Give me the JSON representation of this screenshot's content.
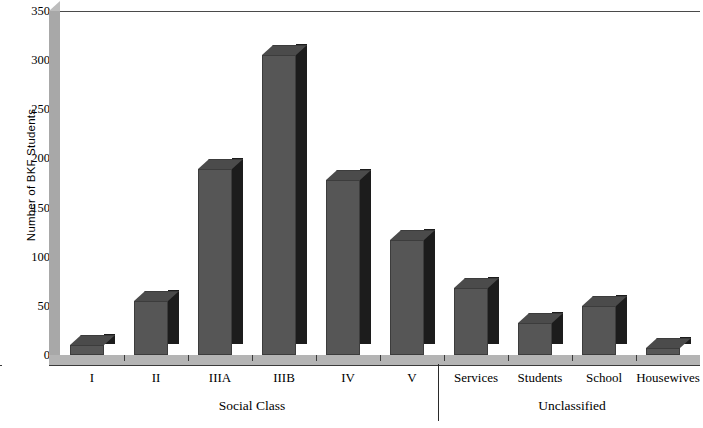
{
  "chart_data": {
    "type": "bar",
    "title": "",
    "xlabel": "",
    "ylabel": "Number of BKF Students",
    "categories": [
      "I",
      "II",
      "IIIA",
      "IIIB",
      "IV",
      "V",
      "Services",
      "Students",
      "School",
      "Housewives"
    ],
    "values": [
      10,
      55,
      189,
      305,
      178,
      117,
      68,
      33,
      50,
      7
    ],
    "ylim": [
      0,
      350
    ],
    "ytick_labels": [
      "0",
      "50",
      "100",
      "150",
      "200",
      "250",
      "300",
      "350"
    ],
    "ytick_values": [
      0,
      50,
      100,
      150,
      200,
      250,
      300,
      350
    ],
    "grid": false,
    "legend": "none",
    "group_labels": [
      {
        "label": "Social Class",
        "categories": [
          "I",
          "II",
          "IIIA",
          "IIIB",
          "IV",
          "V"
        ]
      },
      {
        "label": "Unclassified",
        "categories": [
          "Services",
          "Students",
          "School",
          "Housewives"
        ]
      }
    ],
    "bar_style": "3d-block",
    "colors": {
      "bar_front": "#565656",
      "bar_side": "#1c1c1c",
      "bar_top": "#4b4b4b",
      "axis": "#3a3a3a",
      "wall": "#a8a8a8",
      "floor": "#b4b4b4",
      "background": "#ffffff"
    }
  }
}
